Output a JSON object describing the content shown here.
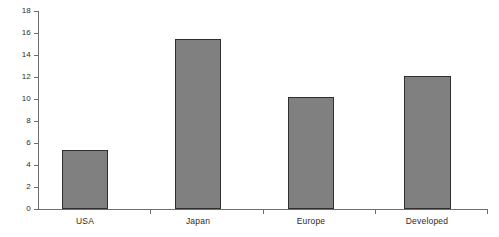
{
  "chart_data": {
    "type": "bar",
    "title": "",
    "subtitle": "",
    "xlabel": "",
    "ylabel": "",
    "categories": [
      "USA",
      "Japan",
      "Europe",
      "Developed"
    ],
    "values": [
      5.4,
      15.5,
      10.2,
      12.1
    ],
    "series": [
      {
        "name": "",
        "values": [
          5.4,
          15.5,
          10.2,
          12.1
        ]
      }
    ],
    "ylim": [
      0,
      18
    ],
    "ytick_labels": [
      "0",
      "2",
      "4",
      "6",
      "8",
      "10",
      "12",
      "14",
      "16",
      "18"
    ],
    "ytick_values": [
      0,
      2,
      4,
      6,
      8,
      10,
      12,
      14,
      16,
      18
    ],
    "grid": false,
    "legend": false,
    "legend_position": "none",
    "annotations": [],
    "bar_fill_color": "#808080",
    "bar_border_color": "#2f2f2f",
    "axis_color": "#6e6e6e",
    "background_color": "#ffffff"
  }
}
